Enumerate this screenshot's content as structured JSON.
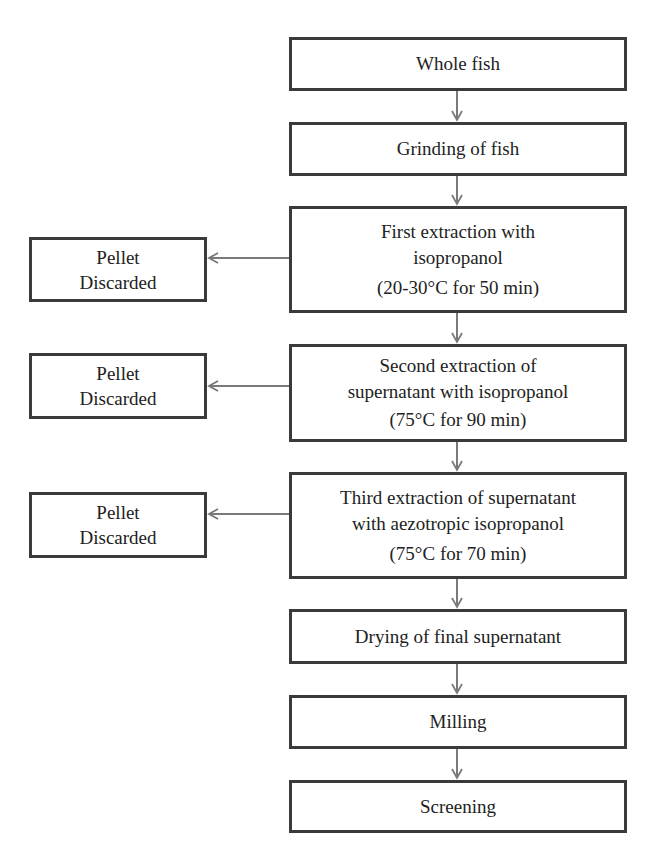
{
  "diagram": {
    "type": "flowchart",
    "arrow_color": "#7a7a7a",
    "border_color": "#3a3a3a",
    "steps": [
      {
        "lines": [
          "Whole fish"
        ]
      },
      {
        "lines": [
          "Grinding of fish"
        ]
      },
      {
        "lines": [
          "First extraction with",
          "isopropanol",
          "(20-30°C for 50 min)"
        ]
      },
      {
        "lines": [
          "Second extraction of",
          "supernatant with isopropanol",
          "(75°C for 90 min)"
        ]
      },
      {
        "lines": [
          "Third extraction of supernatant",
          "with aezotropic isopropanol",
          "(75°C for 70 min)"
        ]
      },
      {
        "lines": [
          "Drying of final supernatant"
        ]
      },
      {
        "lines": [
          "Milling"
        ]
      },
      {
        "lines": [
          "Screening"
        ]
      }
    ],
    "side_outputs": [
      {
        "from_step": 2,
        "lines": [
          "Pellet",
          "Discarded"
        ]
      },
      {
        "from_step": 3,
        "lines": [
          "Pellet",
          "Discarded"
        ]
      },
      {
        "from_step": 4,
        "lines": [
          "Pellet",
          "Discarded"
        ]
      }
    ]
  }
}
